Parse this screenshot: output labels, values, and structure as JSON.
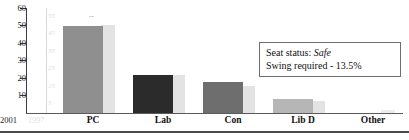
{
  "chart_data": {
    "type": "bar",
    "title": "",
    "xlabel": "",
    "ylabel": "",
    "grid": false,
    "legend_position": "x-axis-left",
    "categories": [
      "PC",
      "Lab",
      "Con",
      "Lib D",
      "Other"
    ],
    "series": [
      {
        "name": "2001",
        "color": "#8f8f8f",
        "values": [
          49.5,
          22,
          18,
          8,
          0
        ]
      },
      {
        "name": "1997",
        "color": "#e3e3e3",
        "values": [
          50.5,
          22,
          15.5,
          7,
          1.5
        ]
      }
    ],
    "primary_axis": {
      "label": "2001",
      "ticks": [
        "60",
        "50",
        "40",
        "30",
        "20",
        "10"
      ],
      "ylim": [
        0,
        60
      ]
    },
    "secondary_axis": {
      "label": "1997",
      "ticks": [
        "55",
        "45",
        "35",
        "25",
        "15",
        "5"
      ],
      "ylim": [
        0,
        60
      ]
    }
  },
  "annotation": {
    "seat_status_label": "Seat status:",
    "seat_status_value": "Safe",
    "swing_line": "Swing required - 13.5%"
  }
}
